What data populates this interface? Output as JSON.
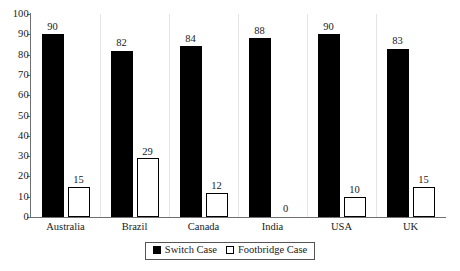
{
  "chart_data": {
    "type": "bar",
    "title": "",
    "subtitle": "",
    "xlabel": "",
    "ylabel": "",
    "ylim": [
      0,
      100
    ],
    "ytick_step": 10,
    "yticks": [
      100,
      90,
      80,
      70,
      60,
      50,
      40,
      30,
      20,
      10,
      0
    ],
    "grid": false,
    "legend_position": "bottom-center",
    "categories": [
      "Australia",
      "Brazil",
      "Canada",
      "India",
      "USA",
      "UK"
    ],
    "series": [
      {
        "name": "Switch Case",
        "color": "#000000",
        "style": "filled",
        "values": [
          90,
          82,
          84,
          88,
          90,
          83
        ]
      },
      {
        "name": "Footbridge Case",
        "color": "#ffffff",
        "style": "hollow",
        "values": [
          15,
          29,
          12,
          0,
          10,
          15
        ]
      }
    ],
    "data_labels": {
      "Switch Case": [
        "90",
        "82",
        "84",
        "88",
        "90",
        "83"
      ],
      "Footbridge Case": [
        "15",
        "29",
        "12",
        "0",
        "10",
        "15"
      ]
    }
  },
  "legend": {
    "entries": [
      {
        "label": "Switch Case",
        "swatch": "filled-square-icon"
      },
      {
        "label": "Footbridge Case",
        "swatch": "hollow-square-icon"
      }
    ]
  },
  "colors": {
    "bar_switch": "#000000",
    "bar_footbridge_fill": "#ffffff",
    "bar_footbridge_stroke": "#000000",
    "axis": "#6f6f6f",
    "text": "#1a1a1a",
    "background": "#ffffff",
    "separator": "#e4e4e4"
  }
}
